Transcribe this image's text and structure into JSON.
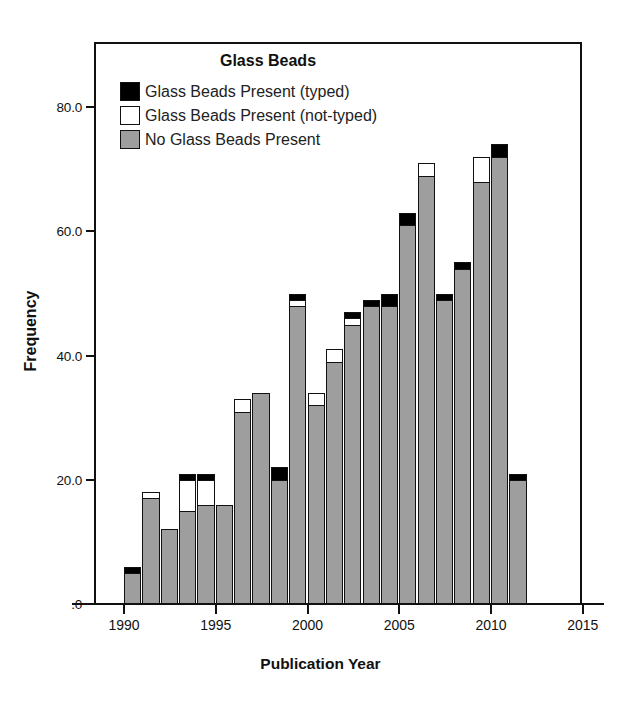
{
  "chart_data": {
    "type": "bar",
    "stacked": true,
    "title": "Glass Beads",
    "xlabel": "Publication Year",
    "ylabel": "Frequency",
    "xlim": [
      1989,
      2016
    ],
    "ylim": [
      0,
      88
    ],
    "grid": false,
    "legend_position": "top-center-inside",
    "x_tick_labels": [
      "1990",
      "1995",
      "2000",
      "2005",
      "2010",
      "2015"
    ],
    "x_tick_values": [
      1990,
      1995,
      2000,
      2005,
      2010,
      2015
    ],
    "y_tick_labels": [
      ".0",
      "20.0",
      "40.0",
      "60.0",
      "80.0"
    ],
    "y_tick_values": [
      0,
      20,
      40,
      60,
      80
    ],
    "categories": [
      1990,
      1991,
      1992,
      1993,
      1994,
      1995,
      1996,
      1997,
      1998,
      1999,
      2000,
      2001,
      2002,
      2003,
      2004,
      2005,
      2006,
      2007,
      2008,
      2009,
      2010,
      2011
    ],
    "series": [
      {
        "name": "No Glass Beads Present",
        "color": "#9e9e9e",
        "values": [
          5,
          17,
          12,
          15,
          16,
          16,
          31,
          34,
          20,
          48,
          32,
          39,
          45,
          48,
          48,
          61,
          69,
          49,
          54,
          68,
          72,
          20
        ]
      },
      {
        "name": "Glass Beads Present (not-typed)",
        "color": "#ffffff",
        "values": [
          0,
          1,
          0,
          5,
          4,
          0,
          2,
          0,
          0,
          1,
          2,
          2,
          1,
          0,
          0,
          0,
          2,
          0,
          0,
          4,
          0,
          0
        ]
      },
      {
        "name": "Glass Beads Present (typed)",
        "color": "#000000",
        "values": [
          1,
          0,
          0,
          1,
          1,
          0,
          0,
          0,
          2,
          1,
          0,
          0,
          1,
          1,
          2,
          2,
          0,
          1,
          1,
          0,
          2,
          1
        ]
      }
    ],
    "totals": [
      6,
      18,
      12,
      21,
      21,
      16,
      33,
      34,
      22,
      50,
      34,
      41,
      47,
      49,
      50,
      63,
      71,
      50,
      55,
      72,
      74,
      21
    ]
  },
  "legend": {
    "title": "Glass Beads",
    "items": [
      {
        "label": "Glass Beads Present (typed)",
        "swatch": "#000000"
      },
      {
        "label": "Glass Beads Present (not-typed)",
        "swatch": "#ffffff"
      },
      {
        "label": "No Glass Beads Present",
        "swatch": "#9e9e9e"
      }
    ]
  },
  "axes": {
    "y_title": "Frequency",
    "x_title": "Publication Year"
  }
}
